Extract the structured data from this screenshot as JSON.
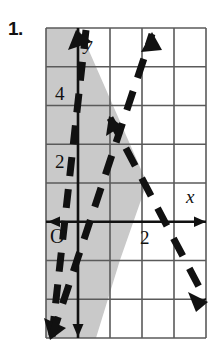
{
  "figure": {
    "problem_number": "1.",
    "type": "coordinate-grid-inequality-graph",
    "axis_labels": {
      "x": "x",
      "y": "y",
      "origin": "O"
    },
    "tick_labels": {
      "y_four": "4",
      "y_two": "2",
      "x_two": "2"
    },
    "colors": {
      "grid_line": "#5a5a5a",
      "axis_line": "#111111",
      "shade_fill": "#c9c9c9",
      "dashed_line": "#111111",
      "background": "#ffffff"
    },
    "grid": {
      "columns": 5,
      "rows": 8,
      "cell_width": 32,
      "cell_height": 38.75,
      "left": 46,
      "top": 28,
      "right": 206,
      "bottom": 338
    },
    "axes": {
      "y_axis_x_px": 78,
      "x_axis_y_px": 221.75,
      "x_range": [
        -1,
        4
      ],
      "y_range": [
        -4,
        4
      ]
    },
    "boundary_lines": [
      {
        "name": "steep-negative-dashed-line",
        "style": "dashed",
        "arrows": [
          "up-left",
          "down-left"
        ],
        "description": "Steep line through upper-left descending to lower-left corner"
      },
      {
        "name": "positive-slope-dashed-line",
        "style": "dashed",
        "arrows": [
          "up-right",
          "down-left"
        ],
        "description": "Positive slope line rising to the upper middle-right"
      },
      {
        "name": "negative-slope-dashed-line",
        "style": "dashed",
        "arrows": [
          "up-left",
          "down-right"
        ],
        "description": "Negative slope line falling to the lower-right corner"
      }
    ],
    "shaded_region": {
      "name": "solution-region",
      "fill": "#c9c9c9",
      "description": "Gray shaded region to the left of the steep dashed boundary line"
    }
  }
}
